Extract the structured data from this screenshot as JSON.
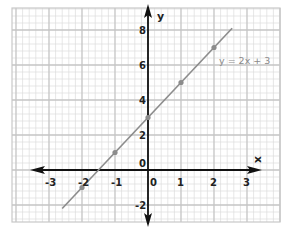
{
  "chart_data": {
    "type": "line",
    "title": "",
    "xlabel": "x",
    "ylabel": "y",
    "xlim": [
      -3.5,
      3.9
    ],
    "ylim": [
      -2.9,
      9.3
    ],
    "grid": true,
    "x_ticks": [
      "-3",
      "-2",
      "-1",
      "0",
      "1",
      "2",
      "3"
    ],
    "y_ticks": [
      "8",
      "6",
      "4",
      "2",
      "0",
      "-2"
    ],
    "series": [
      {
        "name": "y = 2x + 3",
        "equation": "y = 2x + 3",
        "line_color": "#8c8c8c",
        "marker_color": "#8c8c8c",
        "line_extent": {
          "x_start": -2.6,
          "x_end": 2.55
        },
        "points": [
          {
            "x": -2,
            "y": -1
          },
          {
            "x": -1,
            "y": 1
          },
          {
            "x": 0,
            "y": 3
          },
          {
            "x": 1,
            "y": 5
          },
          {
            "x": 2,
            "y": 7
          }
        ]
      }
    ],
    "annotations": [
      {
        "text": "y = 2x + 3",
        "near": {
          "x": 2.1,
          "y": 5.8
        }
      }
    ],
    "legend": null
  },
  "labels": {
    "x_axis": "x",
    "y_axis": "y",
    "equation": "y = 2x + 3",
    "origin_y": "0",
    "origin_x": "0"
  },
  "colors": {
    "grid_minor": "#dcdcdc",
    "grid_major": "#c4c4c4",
    "axis": "#111111",
    "line": "#8c8c8c"
  }
}
